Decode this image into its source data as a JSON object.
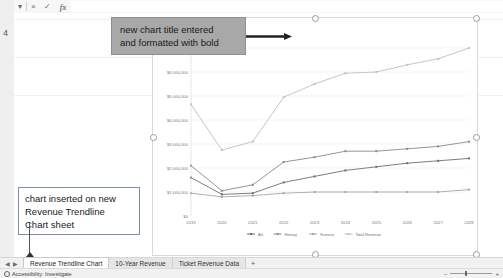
{
  "app": {
    "formula_bar": {
      "name_dropdown_icon": "chevron-down-icon",
      "cancel_icon": "×",
      "confirm_icon": "✓",
      "function_icon": "fx",
      "value": ""
    },
    "row_header_label": "4"
  },
  "chart": {
    "title": "Ticket Revenue 2019 - 2028",
    "title_is_bold": true,
    "selected": true
  },
  "callouts": [
    {
      "id": "title-note",
      "lines": [
        "new chart title entered",
        "and formatted with bold"
      ],
      "style": "gray-filled",
      "has_arrow": true
    },
    {
      "id": "sheet-note",
      "lines": [
        "chart inserted on new",
        "Revenue Trendline",
        "Chart sheet"
      ],
      "style": "white-outline",
      "has_arrow": true
    }
  ],
  "tabs": {
    "nav_icons": [
      "first-icon",
      "prev-icon",
      "next-icon",
      "last-icon"
    ],
    "items": [
      {
        "label": "Revenue Trendline Chart",
        "active": true
      },
      {
        "label": "10-Year Revenue",
        "active": false
      },
      {
        "label": "Ticket Revenue Data",
        "active": false
      }
    ],
    "add_label": "+"
  },
  "status": {
    "accessibility": "Accessibility: Investigate",
    "zoom": "100%"
  },
  "chart_data": {
    "type": "line",
    "title": "Ticket Revenue 2019 - 2028",
    "xlabel": "",
    "ylabel": "",
    "x": [
      "2019",
      "2020",
      "2021",
      "2022",
      "2023",
      "2024",
      "2025",
      "2026",
      "2027",
      "2028"
    ],
    "ylim": [
      0,
      7000000
    ],
    "ytick_values": [
      0,
      1000000,
      2000000,
      3000000,
      4000000,
      5000000,
      6000000,
      7000000
    ],
    "ytick_labels": [
      "$0",
      "$1,000,000",
      "$2,000,000",
      "$3,000,000",
      "$4,000,000",
      "$5,000,000",
      "$6,000,000",
      "$7,000,000"
    ],
    "grid": true,
    "legend_position": "bottom",
    "markers": true,
    "series": [
      {
        "name": "Art",
        "color": "#6f6f6f",
        "values": [
          1600000,
          900000,
          950000,
          1400000,
          1650000,
          1900000,
          2050000,
          2200000,
          2300000,
          2400000
        ]
      },
      {
        "name": "History",
        "color": "#8a8a8a",
        "values": [
          2100000,
          1050000,
          1300000,
          2250000,
          2450000,
          2700000,
          2700000,
          2800000,
          2900000,
          3100000
        ]
      },
      {
        "name": "Science",
        "color": "#a6a6a6",
        "values": [
          950000,
          800000,
          850000,
          950000,
          1000000,
          1000000,
          1000000,
          1000000,
          1000000,
          1100000
        ]
      },
      {
        "name": "Total Revenue",
        "color": "#c0c0c0",
        "values": [
          4650000,
          2750000,
          3100000,
          4950000,
          5500000,
          5950000,
          6000000,
          6300000,
          6550000,
          7000000
        ]
      }
    ]
  }
}
